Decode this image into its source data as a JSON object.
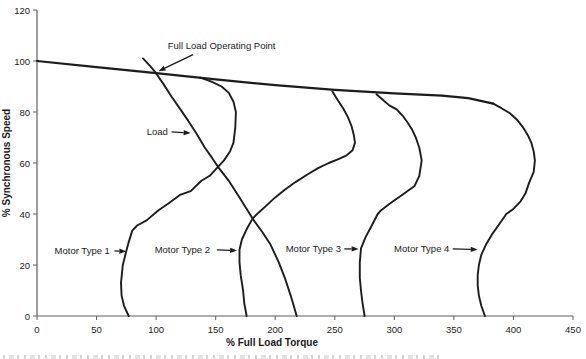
{
  "page": {
    "background": "#ffffff"
  },
  "chart_data": {
    "type": "line",
    "title": "",
    "xlabel": "% Full Load Torque",
    "ylabel": "% Synchronous Speed",
    "xlim": [
      0,
      450
    ],
    "ylim": [
      0,
      120
    ],
    "xticks": [
      0,
      50,
      100,
      150,
      200,
      250,
      300,
      350,
      400,
      450
    ],
    "yticks": [
      0,
      20,
      40,
      60,
      80,
      100,
      120
    ],
    "grid": false,
    "legend": null,
    "colors": {
      "curve": "#1c1c1c",
      "axis": "#5f5f5f",
      "text": "#1a1a1a"
    },
    "series": [
      {
        "name": "Speed line (near-synchronous branch)",
        "width": 2.2,
        "points": [
          [
            0,
            100
          ],
          [
            50,
            97.6
          ],
          [
            100,
            95.2
          ],
          [
            150,
            92.8
          ],
          [
            200,
            90.5
          ],
          [
            250,
            88.7
          ],
          [
            300,
            87.3
          ],
          [
            340,
            86.4
          ],
          [
            362,
            85.4
          ],
          [
            383,
            83.3
          ]
        ]
      },
      {
        "name": "Load",
        "width": 1.9,
        "points": [
          [
            89,
            101
          ],
          [
            95,
            98
          ],
          [
            100,
            95.2
          ],
          [
            106,
            91
          ],
          [
            113,
            86
          ],
          [
            119,
            82
          ],
          [
            127,
            76.5
          ],
          [
            134,
            71.5
          ],
          [
            141,
            66
          ],
          [
            147,
            62
          ],
          [
            152,
            58.5
          ],
          [
            161,
            53
          ],
          [
            170,
            46.5
          ],
          [
            181,
            38.2
          ],
          [
            189,
            33
          ],
          [
            196,
            28
          ],
          [
            203,
            21
          ],
          [
            208,
            15
          ],
          [
            213,
            8
          ],
          [
            218,
            0
          ]
        ]
      },
      {
        "name": "Motor Type 1",
        "width": 1.9,
        "points": [
          [
            137,
            93.5
          ],
          [
            146,
            92
          ],
          [
            155,
            90
          ],
          [
            161,
            87.5
          ],
          [
            165,
            84
          ],
          [
            167,
            80
          ],
          [
            166.5,
            74
          ],
          [
            165,
            68
          ],
          [
            162,
            64.5
          ],
          [
            157,
            61
          ],
          [
            152,
            58.5
          ],
          [
            145,
            55
          ],
          [
            138,
            53
          ],
          [
            129,
            49
          ],
          [
            120,
            47.5
          ],
          [
            110,
            44
          ],
          [
            102,
            41.5
          ],
          [
            92,
            37.5
          ],
          [
            84,
            35.5
          ],
          [
            80,
            33.5
          ],
          [
            77,
            29
          ],
          [
            75,
            25.5
          ],
          [
            72,
            20
          ],
          [
            70.5,
            13
          ],
          [
            71,
            8
          ],
          [
            73,
            4
          ],
          [
            77,
            0
          ]
        ]
      },
      {
        "name": "Motor Type 2",
        "width": 1.9,
        "points": [
          [
            248,
            88
          ],
          [
            252,
            85
          ],
          [
            257,
            81.5
          ],
          [
            261,
            78
          ],
          [
            264,
            74.5
          ],
          [
            266,
            71
          ],
          [
            267,
            68
          ],
          [
            265,
            65
          ],
          [
            260,
            63
          ],
          [
            253,
            61.5
          ],
          [
            245,
            60
          ],
          [
            236,
            58
          ],
          [
            227,
            55.5
          ],
          [
            217,
            52.5
          ],
          [
            208,
            49.5
          ],
          [
            200,
            46.5
          ],
          [
            193,
            43.5
          ],
          [
            186,
            40.5
          ],
          [
            181,
            38.2
          ],
          [
            176,
            34
          ],
          [
            172,
            30
          ],
          [
            170,
            26
          ],
          [
            170,
            21
          ],
          [
            171,
            16
          ],
          [
            173,
            10
          ],
          [
            174,
            5
          ],
          [
            176,
            0
          ]
        ]
      },
      {
        "name": "Motor Type 3",
        "width": 1.9,
        "points": [
          [
            285,
            87
          ],
          [
            291,
            84.5
          ],
          [
            296,
            82.5
          ],
          [
            302,
            81
          ],
          [
            307,
            78.5
          ],
          [
            311,
            76
          ],
          [
            315,
            73
          ],
          [
            318,
            70
          ],
          [
            321,
            66
          ],
          [
            323,
            61
          ],
          [
            321,
            55
          ],
          [
            317,
            51
          ],
          [
            305,
            47
          ],
          [
            296,
            44
          ],
          [
            289,
            41.5
          ],
          [
            286,
            40
          ],
          [
            280,
            34.5
          ],
          [
            276,
            31
          ],
          [
            272,
            26.5
          ],
          [
            271,
            21
          ],
          [
            271,
            15
          ],
          [
            272,
            10
          ],
          [
            273,
            6
          ],
          [
            275,
            0
          ]
        ]
      },
      {
        "name": "Motor Type 4",
        "width": 1.9,
        "points": [
          [
            383,
            83.3
          ],
          [
            390,
            81.5
          ],
          [
            397,
            79.5
          ],
          [
            403,
            77
          ],
          [
            408,
            74
          ],
          [
            412,
            71
          ],
          [
            415,
            68
          ],
          [
            417,
            64.5
          ],
          [
            418,
            61
          ],
          [
            417,
            56.5
          ],
          [
            413,
            52
          ],
          [
            410,
            48
          ],
          [
            406,
            45
          ],
          [
            400,
            42
          ],
          [
            394,
            40
          ],
          [
            388,
            36
          ],
          [
            382,
            32
          ],
          [
            377,
            28
          ],
          [
            373,
            24
          ],
          [
            371,
            20
          ],
          [
            370,
            16
          ],
          [
            370,
            12
          ],
          [
            371,
            8
          ],
          [
            373,
            4
          ],
          [
            376,
            0
          ]
        ]
      }
    ],
    "annotations": [
      {
        "label": "Full Load Operating Point",
        "x": 155,
        "y": 106,
        "arrow": {
          "x1": 131,
          "y1": 102.5,
          "x2": 102,
          "y2": 96
        }
      },
      {
        "label": "Load",
        "x": 101,
        "y": 72.3,
        "arrow": {
          "x1": 113,
          "y1": 72.2,
          "x2": 129,
          "y2": 71.8
        }
      },
      {
        "label": "Motor Type 1",
        "x": 38,
        "y": 25.5,
        "arrow": {
          "x1": 65,
          "y1": 25.5,
          "x2": 75,
          "y2": 25.3
        }
      },
      {
        "label": "Motor Type 2",
        "x": 122,
        "y": 25.9,
        "arrow": {
          "x1": 151,
          "y1": 25.9,
          "x2": 168,
          "y2": 25.7
        }
      },
      {
        "label": "Motor Type 3",
        "x": 232,
        "y": 26.3,
        "arrow": {
          "x1": 258,
          "y1": 26.3,
          "x2": 270,
          "y2": 26.3
        }
      },
      {
        "label": "Motor Type 4",
        "x": 323,
        "y": 26.3,
        "arrow": {
          "x1": 349,
          "y1": 26.3,
          "x2": 370,
          "y2": 26.1
        }
      }
    ]
  }
}
